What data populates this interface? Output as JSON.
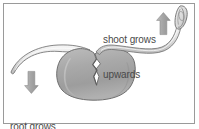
{
  "figure": {
    "background_color": "#ffffff",
    "border_color": "#9a9a9a",
    "text_color": "#4a4a4a",
    "arrow_color": "#a8a8a8",
    "outline_color": "#6b6b6b",
    "seed_fill": "#a9a9a9",
    "shoot_fill": "#e2e2e2"
  },
  "labels": {
    "shoot": {
      "line1": "shoot grows",
      "line2": "upwards",
      "full": "shoot grows upwards"
    },
    "root": {
      "line1": "root grows",
      "line2": "downwards",
      "full": "root grows downwards"
    }
  },
  "arrows": {
    "up": {
      "direction": "up",
      "name": "up-arrow",
      "meaning": "shoot grows upwards"
    },
    "down": {
      "direction": "down",
      "name": "down-arrow",
      "meaning": "root grows downwards"
    }
  },
  "parts": {
    "seed": "seed",
    "shoot": "shoot",
    "shoot_tip": "shoot tip bud",
    "root": "root",
    "root_tip": "root tip"
  }
}
